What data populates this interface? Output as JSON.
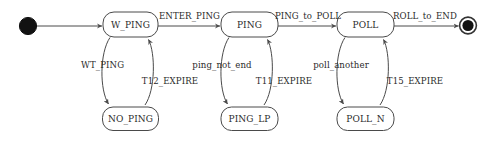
{
  "diagram": {
    "kind": "state-machine-diagram",
    "initial_node": {
      "name": "initial-state"
    },
    "final_node": {
      "name": "final-state"
    },
    "states": [
      {
        "label": "W_PING"
      },
      {
        "label": "PING"
      },
      {
        "label": "POLL"
      },
      {
        "label": "NO_PING"
      },
      {
        "label": "PING_LP"
      },
      {
        "label": "POLL_N"
      }
    ],
    "transitions": [
      {
        "label": "ENTER_PING",
        "from": "W_PING",
        "to": "PING"
      },
      {
        "label": "PING_to_POLL",
        "from": "PING",
        "to": "POLL"
      },
      {
        "label": "ROLL_to_END",
        "from": "POLL",
        "to": "final-state"
      },
      {
        "label": "WT_PING",
        "from": "W_PING",
        "to": "NO_PING"
      },
      {
        "label": "T12_EXPIRE",
        "from": "NO_PING",
        "to": "W_PING"
      },
      {
        "label": "ping_not_end",
        "from": "PING",
        "to": "PING_LP"
      },
      {
        "label": "T11_EXPIRE",
        "from": "PING_LP",
        "to": "PING"
      },
      {
        "label": "poll_another",
        "from": "POLL",
        "to": "POLL_N"
      },
      {
        "label": "T15_EXPIRE",
        "from": "POLL_N",
        "to": "POLL"
      }
    ],
    "colors": {
      "background": "#ffffff",
      "stroke": "#4a4a4a",
      "text": "#2b2b2b",
      "node_fill": "#ffffff",
      "initial_fill": "#121212"
    }
  }
}
